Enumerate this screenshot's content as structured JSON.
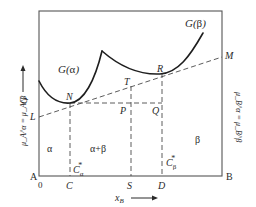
{
  "diagram": {
    "axes": {
      "y_label": "G",
      "x_label": "x",
      "x_label_sub": "B",
      "corner_left": "A",
      "corner_right": "B",
      "origin": "0"
    },
    "curves": {
      "alpha": {
        "label_main": "G(",
        "label_greek": "α",
        "label_close": ")"
      },
      "beta": {
        "label_main": "G(",
        "label_greek": "β",
        "label_close": ")"
      }
    },
    "points": {
      "N": "N",
      "T": "T",
      "R": "R",
      "P": "P",
      "Q": "Q",
      "L": "L",
      "M": "M"
    },
    "x_ticks": {
      "C": "C",
      "S": "S",
      "D": "D"
    },
    "compositions": {
      "c_alpha": {
        "base": "C",
        "sub": "α",
        "sup": "*"
      },
      "c_beta": {
        "base": "C",
        "sub": "β",
        "sup": "*"
      }
    },
    "regions": {
      "alpha": "α",
      "alpha_beta": "α+β",
      "beta": "β"
    },
    "chem_potential_left": "μ_A^α = μ_A^β",
    "chem_potential_right": "μ_B^α = μ_B^β",
    "colors": {
      "curve": "#1e1e1e",
      "frame": "#555555",
      "dashed": "#4a4a4a",
      "text": "#2a2a2a"
    }
  }
}
